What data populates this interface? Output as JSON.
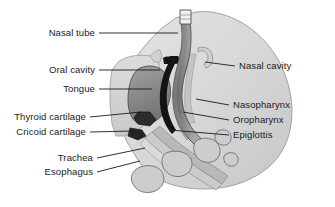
{
  "figure": {
    "type": "medical-illustration",
    "background_color": "#ffffff",
    "palette": {
      "head_fill": "#d4d4d4",
      "head_fill_light": "#e2e2e2",
      "head_outline": "#8c8c8c",
      "tongue_fill": "#8e8e8e",
      "tongue_outline": "#5a5a5a",
      "airway_black": "#141414",
      "tube_dark": "#6f6f6f",
      "tube_mid": "#9a9a9a",
      "tube_tip": "#f2f2f2",
      "vertebra_fill": "#cfcfcf",
      "vertebra_outline": "#707070",
      "leader_line": "#1a1a1a",
      "label_text": "#1a1a1a"
    },
    "labels_left": [
      {
        "id": "nasal-tube",
        "text": "Nasal tube",
        "text_x": 95,
        "text_y": 33,
        "line_x1": 99,
        "line_y1": 33,
        "line_x2": 178,
        "line_y2": 33
      },
      {
        "id": "oral-cavity",
        "text": "Oral cavity",
        "text_x": 95,
        "text_y": 70,
        "line_x1": 99,
        "line_y1": 70,
        "line_x2": 160,
        "line_y2": 70
      },
      {
        "id": "tongue",
        "text": "Tongue",
        "text_x": 95,
        "text_y": 89,
        "line_x1": 99,
        "line_y1": 89,
        "line_x2": 152,
        "line_y2": 89
      },
      {
        "id": "thyroid-cartilage",
        "text": "Thyroid cartilage",
        "text_x": 86,
        "text_y": 117,
        "line_x1": 90,
        "line_y1": 117,
        "line_x2": 141,
        "line_y2": 112
      },
      {
        "id": "cricoid-cartilage",
        "text": "Cricoid cartilage",
        "text_x": 86,
        "text_y": 132,
        "line_x1": 90,
        "line_y1": 132,
        "line_x2": 133,
        "line_y2": 131
      },
      {
        "id": "trachea",
        "text": "Trachea",
        "text_x": 93,
        "text_y": 158,
        "line_x1": 97,
        "line_y1": 158,
        "line_x2": 145,
        "line_y2": 148
      },
      {
        "id": "esophagus",
        "text": "Esophagus",
        "text_x": 93,
        "text_y": 172,
        "line_x1": 97,
        "line_y1": 172,
        "line_x2": 140,
        "line_y2": 161
      }
    ],
    "labels_right": [
      {
        "id": "nasal-cavity",
        "text": "Nasal cavity",
        "text_x": 239,
        "text_y": 66,
        "line_x1": 235,
        "line_y1": 66,
        "line_x2": 205,
        "line_y2": 62
      },
      {
        "id": "nasopharynx",
        "text": "Nasopharynx",
        "text_x": 233,
        "text_y": 105,
        "line_x1": 229,
        "line_y1": 105,
        "line_x2": 196,
        "line_y2": 99
      },
      {
        "id": "oropharynx",
        "text": "Oropharynx",
        "text_x": 233,
        "text_y": 120,
        "line_x1": 229,
        "line_y1": 120,
        "line_x2": 183,
        "line_y2": 112
      },
      {
        "id": "epiglottis",
        "text": "Epiglottis",
        "text_x": 233,
        "text_y": 135,
        "line_x1": 229,
        "line_y1": 135,
        "line_x2": 170,
        "line_y2": 130
      }
    ]
  }
}
